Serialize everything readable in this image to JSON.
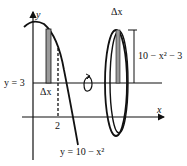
{
  "diagram": {
    "labels": {
      "y_axis": "y",
      "x_axis": "x",
      "horizontal_line": "y = 3",
      "strip_width_left": "Δx",
      "x_tick": "2",
      "curve": "y = 10 − x²",
      "strip_width_right": "Δx",
      "radius": "10 − x² − 3"
    },
    "colors": {
      "stroke": "#111111",
      "strip_fill": "#9a9a9a",
      "background": "#ffffff"
    }
  }
}
